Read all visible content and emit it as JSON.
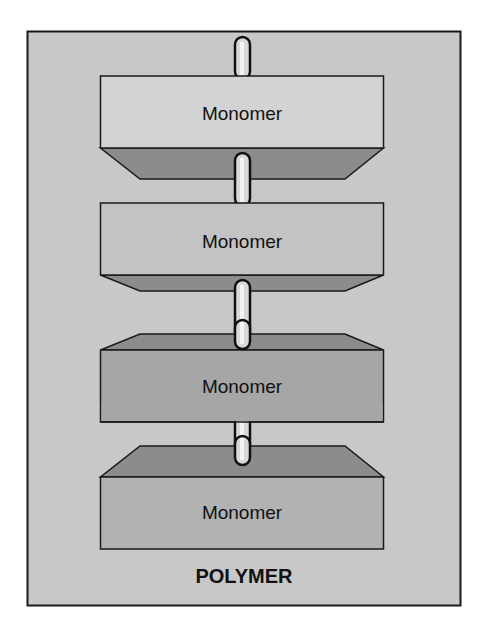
{
  "diagram": {
    "title": "POLYMER",
    "colors": {
      "background": "#c8c8c8",
      "frame_border": "#1a1a1a",
      "bevel": "#8c8c8c",
      "rod_fill": "#d8d8d8",
      "rod_border": "#111111"
    },
    "monomers": [
      {
        "label": "Monomer",
        "face_color": "#d3d3d3",
        "bevel": "bottom"
      },
      {
        "label": "Monomer",
        "face_color": "#c3c3c3",
        "bevel": "bottom"
      },
      {
        "label": "Monomer",
        "face_color": "#a6a6a6",
        "bevel": "top"
      },
      {
        "label": "Monomer",
        "face_color": "#b2b2b2",
        "bevel": "top"
      }
    ]
  }
}
